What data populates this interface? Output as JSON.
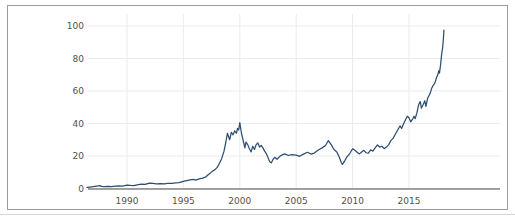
{
  "figure": {
    "background": "#ffffff",
    "border_color": "#9c9c9c",
    "outer_rule_color": "#d6d6d6"
  },
  "chart_data": {
    "type": "line",
    "title": "",
    "xlabel": "",
    "ylabel": "",
    "legend": "none",
    "grid": true,
    "x_tick_labels": [
      "1990",
      "1995",
      "2000",
      "2005",
      "2010",
      "2015"
    ],
    "x_tick_values": [
      1990,
      1995,
      2000,
      2005,
      2010,
      2015
    ],
    "y_tick_labels": [
      "0",
      "20",
      "40",
      "60",
      "80",
      "100"
    ],
    "y_tick_values": [
      0,
      20,
      40,
      60,
      80,
      100
    ],
    "xlim": [
      1986.4,
      2023.1
    ],
    "ylim": [
      0,
      107
    ],
    "line_color": "#2e4d71",
    "axis_color": "#4d4d4d",
    "grid_color": "#ebebeb",
    "tick_label_color": "#55504a",
    "series": [
      {
        "name": "price",
        "points": [
          [
            1986.45,
            0.7
          ],
          [
            1986.7,
            0.9
          ],
          [
            1987.0,
            1.1
          ],
          [
            1987.3,
            1.5
          ],
          [
            1987.6,
            1.8
          ],
          [
            1987.75,
            1.3
          ],
          [
            1988.0,
            1.2
          ],
          [
            1988.3,
            1.3
          ],
          [
            1988.6,
            1.2
          ],
          [
            1989.0,
            1.4
          ],
          [
            1989.3,
            1.6
          ],
          [
            1989.6,
            1.5
          ],
          [
            1990.0,
            2.1
          ],
          [
            1990.3,
            1.9
          ],
          [
            1990.6,
            1.8
          ],
          [
            1991.0,
            2.4
          ],
          [
            1991.3,
            2.7
          ],
          [
            1991.6,
            2.6
          ],
          [
            1992.0,
            3.3
          ],
          [
            1992.3,
            3.1
          ],
          [
            1992.6,
            2.9
          ],
          [
            1993.0,
            3.0
          ],
          [
            1993.3,
            2.8
          ],
          [
            1993.6,
            3.1
          ],
          [
            1994.0,
            3.2
          ],
          [
            1994.3,
            3.4
          ],
          [
            1994.6,
            3.6
          ],
          [
            1995.0,
            4.4
          ],
          [
            1995.3,
            4.9
          ],
          [
            1995.6,
            5.3
          ],
          [
            1995.9,
            5.6
          ],
          [
            1996.1,
            5.2
          ],
          [
            1996.4,
            5.9
          ],
          [
            1996.7,
            6.4
          ],
          [
            1997.0,
            7.2
          ],
          [
            1997.2,
            8.5
          ],
          [
            1997.4,
            9.6
          ],
          [
            1997.6,
            10.8
          ],
          [
            1997.8,
            11.6
          ],
          [
            1998.0,
            13.0
          ],
          [
            1998.2,
            15.5
          ],
          [
            1998.4,
            18.5
          ],
          [
            1998.6,
            23.0
          ],
          [
            1998.75,
            28.0
          ],
          [
            1998.9,
            34.0
          ],
          [
            1999.0,
            32.0
          ],
          [
            1999.1,
            30.0
          ],
          [
            1999.25,
            34.5
          ],
          [
            1999.4,
            33.0
          ],
          [
            1999.55,
            35.5
          ],
          [
            1999.7,
            34.0
          ],
          [
            1999.8,
            37.0
          ],
          [
            1999.9,
            36.0
          ],
          [
            2000.0,
            40.5
          ],
          [
            2000.08,
            37.0
          ],
          [
            2000.15,
            34.0
          ],
          [
            2000.25,
            31.0
          ],
          [
            2000.35,
            28.0
          ],
          [
            2000.45,
            25.0
          ],
          [
            2000.55,
            28.5
          ],
          [
            2000.7,
            27.0
          ],
          [
            2000.85,
            24.5
          ],
          [
            2001.0,
            22.5
          ],
          [
            2001.15,
            26.0
          ],
          [
            2001.3,
            24.0
          ],
          [
            2001.45,
            27.0
          ],
          [
            2001.6,
            28.0
          ],
          [
            2001.75,
            25.5
          ],
          [
            2001.9,
            26.5
          ],
          [
            2002.05,
            25.0
          ],
          [
            2002.2,
            23.0
          ],
          [
            2002.35,
            21.5
          ],
          [
            2002.5,
            19.0
          ],
          [
            2002.65,
            16.5
          ],
          [
            2002.8,
            15.8
          ],
          [
            2002.95,
            18.0
          ],
          [
            2003.1,
            19.2
          ],
          [
            2003.3,
            18.0
          ],
          [
            2003.5,
            19.5
          ],
          [
            2003.7,
            20.5
          ],
          [
            2004.0,
            21.3
          ],
          [
            2004.3,
            20.3
          ],
          [
            2004.6,
            20.8
          ],
          [
            2005.0,
            20.5
          ],
          [
            2005.3,
            19.8
          ],
          [
            2005.6,
            21.0
          ],
          [
            2006.0,
            22.3
          ],
          [
            2006.3,
            21.2
          ],
          [
            2006.6,
            21.8
          ],
          [
            2007.0,
            23.8
          ],
          [
            2007.3,
            25.0
          ],
          [
            2007.6,
            26.5
          ],
          [
            2007.85,
            29.5
          ],
          [
            2008.1,
            27.0
          ],
          [
            2008.35,
            24.0
          ],
          [
            2008.6,
            22.5
          ],
          [
            2008.8,
            19.5
          ],
          [
            2009.0,
            16.0
          ],
          [
            2009.1,
            14.8
          ],
          [
            2009.3,
            17.0
          ],
          [
            2009.5,
            19.5
          ],
          [
            2009.75,
            21.5
          ],
          [
            2010.0,
            24.5
          ],
          [
            2010.2,
            23.5
          ],
          [
            2010.45,
            22.0
          ],
          [
            2010.6,
            21.3
          ],
          [
            2010.8,
            22.5
          ],
          [
            2011.0,
            23.5
          ],
          [
            2011.2,
            22.0
          ],
          [
            2011.4,
            21.8
          ],
          [
            2011.6,
            23.8
          ],
          [
            2011.8,
            23.0
          ],
          [
            2012.0,
            25.0
          ],
          [
            2012.2,
            26.8
          ],
          [
            2012.4,
            25.5
          ],
          [
            2012.6,
            26.0
          ],
          [
            2012.8,
            24.5
          ],
          [
            2013.0,
            25.5
          ],
          [
            2013.2,
            27.0
          ],
          [
            2013.4,
            29.5
          ],
          [
            2013.6,
            31.0
          ],
          [
            2013.8,
            33.5
          ],
          [
            2014.0,
            36.0
          ],
          [
            2014.2,
            38.5
          ],
          [
            2014.35,
            37.0
          ],
          [
            2014.5,
            39.5
          ],
          [
            2014.7,
            42.5
          ],
          [
            2014.85,
            44.5
          ],
          [
            2015.0,
            43.5
          ],
          [
            2015.15,
            41.0
          ],
          [
            2015.3,
            42.5
          ],
          [
            2015.45,
            44.5
          ],
          [
            2015.55,
            43.0
          ],
          [
            2015.7,
            46.5
          ],
          [
            2015.85,
            51.5
          ],
          [
            2016.0,
            53.5
          ],
          [
            2016.1,
            49.5
          ],
          [
            2016.25,
            51.5
          ],
          [
            2016.4,
            54.0
          ],
          [
            2016.5,
            50.5
          ],
          [
            2016.65,
            55.5
          ],
          [
            2016.8,
            57.5
          ],
          [
            2016.9,
            59.0
          ],
          [
            2017.0,
            61.5
          ],
          [
            2017.15,
            63.5
          ],
          [
            2017.3,
            65.0
          ],
          [
            2017.45,
            68.5
          ],
          [
            2017.55,
            70.0
          ],
          [
            2017.65,
            72.5
          ],
          [
            2017.7,
            71.0
          ],
          [
            2017.8,
            76.0
          ],
          [
            2017.9,
            83.0
          ],
          [
            2017.97,
            86.0
          ],
          [
            2018.02,
            89.5
          ],
          [
            2018.06,
            93.5
          ],
          [
            2018.1,
            97.5
          ]
        ]
      }
    ]
  }
}
